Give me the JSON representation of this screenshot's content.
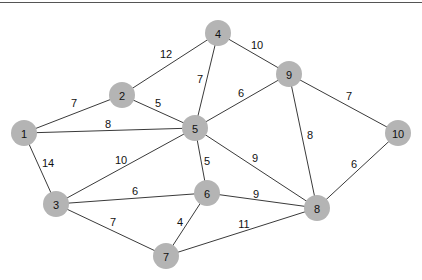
{
  "diagram": {
    "type": "weighted-undirected-graph",
    "node_radius": 13,
    "colors": {
      "node_fill": "#b4b4b4",
      "edge": "#3a3a3a",
      "text": "#111111",
      "background": "#ffffff"
    },
    "nodes": [
      {
        "id": "1",
        "label": "1",
        "x": 24,
        "y": 133
      },
      {
        "id": "2",
        "label": "2",
        "x": 122,
        "y": 95
      },
      {
        "id": "3",
        "label": "3",
        "x": 56,
        "y": 204
      },
      {
        "id": "4",
        "label": "4",
        "x": 218,
        "y": 33
      },
      {
        "id": "5",
        "label": "5",
        "x": 195,
        "y": 128
      },
      {
        "id": "6",
        "label": "6",
        "x": 207,
        "y": 193
      },
      {
        "id": "7",
        "label": "7",
        "x": 166,
        "y": 256
      },
      {
        "id": "8",
        "label": "8",
        "x": 317,
        "y": 208
      },
      {
        "id": "9",
        "label": "9",
        "x": 289,
        "y": 74
      },
      {
        "id": "10",
        "label": "10",
        "x": 398,
        "y": 133
      }
    ],
    "edges": [
      {
        "from": "1",
        "to": "2",
        "weight": "7",
        "lx": 74,
        "ly": 103
      },
      {
        "from": "1",
        "to": "5",
        "weight": "8",
        "lx": 108,
        "ly": 124
      },
      {
        "from": "1",
        "to": "3",
        "weight": "14",
        "lx": 48,
        "ly": 163
      },
      {
        "from": "2",
        "to": "4",
        "weight": "12",
        "lx": 166,
        "ly": 54
      },
      {
        "from": "2",
        "to": "5",
        "weight": "5",
        "lx": 158,
        "ly": 103
      },
      {
        "from": "4",
        "to": "5",
        "weight": "7",
        "lx": 200,
        "ly": 79
      },
      {
        "from": "4",
        "to": "9",
        "weight": "10",
        "lx": 257,
        "ly": 45
      },
      {
        "from": "5",
        "to": "9",
        "weight": "6",
        "lx": 241,
        "ly": 93
      },
      {
        "from": "5",
        "to": "3",
        "weight": "10",
        "lx": 121,
        "ly": 160
      },
      {
        "from": "5",
        "to": "6",
        "weight": "5",
        "lx": 207,
        "ly": 161
      },
      {
        "from": "5",
        "to": "8",
        "weight": "9",
        "lx": 255,
        "ly": 158
      },
      {
        "from": "9",
        "to": "10",
        "weight": "7",
        "lx": 349,
        "ly": 96
      },
      {
        "from": "9",
        "to": "8",
        "weight": "8",
        "lx": 310,
        "ly": 135
      },
      {
        "from": "10",
        "to": "8",
        "weight": "6",
        "lx": 354,
        "ly": 164
      },
      {
        "from": "3",
        "to": "6",
        "weight": "6",
        "lx": 135,
        "ly": 191
      },
      {
        "from": "3",
        "to": "7",
        "weight": "7",
        "lx": 113,
        "ly": 222
      },
      {
        "from": "6",
        "to": "8",
        "weight": "9",
        "lx": 256,
        "ly": 194
      },
      {
        "from": "6",
        "to": "7",
        "weight": "4",
        "lx": 180,
        "ly": 222
      },
      {
        "from": "7",
        "to": "8",
        "weight": "11",
        "lx": 244,
        "ly": 224
      }
    ]
  }
}
